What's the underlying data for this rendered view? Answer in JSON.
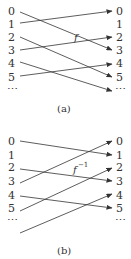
{
  "diagrams": [
    {
      "caption": "(a)",
      "function_label": "f",
      "function_sup": "",
      "left_labels": [
        "0",
        "1",
        "2",
        "3",
        "4",
        "5",
        "⋯"
      ],
      "right_labels": [
        "0",
        "1",
        "2",
        "3",
        "4",
        "5",
        "⋯"
      ],
      "mappings": [
        {
          "from": "0",
          "to": "3"
        },
        {
          "from": "1",
          "to": "0"
        },
        {
          "from": "2",
          "to": "5"
        },
        {
          "from": "3",
          "to": "2"
        },
        {
          "from": "4",
          "to": "⋯"
        },
        {
          "from": "5",
          "to": "4"
        }
      ]
    },
    {
      "caption": "(b)",
      "function_label": "f",
      "function_sup": "−1",
      "left_labels": [
        "0",
        "1",
        "2",
        "3",
        "4",
        "5",
        "⋯"
      ],
      "right_labels": [
        "0",
        "1",
        "2",
        "3",
        "4",
        "5",
        "⋯"
      ],
      "mappings": [
        {
          "from": "0",
          "to": "1"
        },
        {
          "from": "2",
          "to": "3"
        },
        {
          "from": "3",
          "to": "0"
        },
        {
          "from": "4",
          "to": "5"
        },
        {
          "from": "5",
          "to": "2"
        },
        {
          "from": "⋯",
          "to": "4"
        }
      ]
    }
  ]
}
